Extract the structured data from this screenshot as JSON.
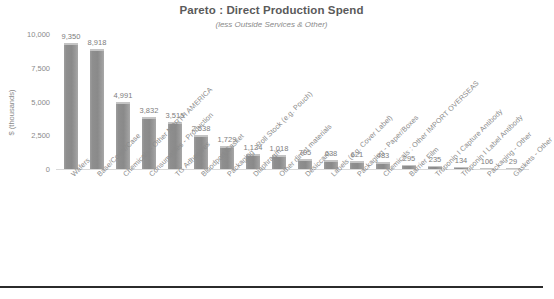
{
  "chart_data": {
    "type": "bar",
    "title": "Pareto : Direct Production Spend",
    "subtitle": "(less Outside Services & Other)",
    "xlabel": "",
    "ylabel": "$ (thousands)",
    "ylim": [
      0,
      10000
    ],
    "grid": false,
    "legend": "none",
    "bar_color": "#8a8a8a",
    "text_color": "#8a8a8a",
    "yticks": [
      "10,000",
      "7,500",
      "5,000",
      "2,500",
      "0"
    ],
    "ytick_values": [
      10000,
      7500,
      5000,
      2500,
      0
    ],
    "categories": [
      "Wafers",
      "Base/Cover/Case",
      "Chemicals - Other NORTH AMERICA",
      "Consumables - Production",
      "TG Adhesives",
      "Bloodport Gasket",
      "Packaging - Roll Stock (e.g. Pouch)",
      "Diaphragm",
      "Other direct materials",
      "Desiccant",
      "Labels (e.g. Cover Label)",
      "Packaging - Paper/Boxes",
      "Chemicals : Other IMPORT OVERSEAS",
      "Barrier Film",
      "Troponin I Capture Antibody",
      "Troponin I Label Antibody",
      "Packaging - Other",
      "Gaskets - Other"
    ],
    "values": [
      9350,
      8918,
      4991,
      3832,
      3515,
      2538,
      1729,
      1134,
      1018,
      705,
      638,
      621,
      483,
      295,
      235,
      134,
      106,
      29
    ],
    "value_labels": [
      "9,350",
      "8,918",
      "4,991",
      "3,832",
      "3,515",
      "2,538",
      "1,729",
      "1,134",
      "1,018",
      "705",
      "638",
      "621",
      "483",
      "295",
      "235",
      "134",
      "106",
      "29"
    ]
  }
}
